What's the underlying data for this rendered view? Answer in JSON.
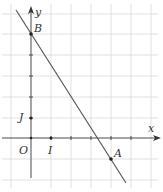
{
  "diagram": {
    "type": "coordinate-plane-line",
    "axes": {
      "x_label": "x",
      "y_label": "y",
      "origin_label": "O",
      "unit_x_label": "I",
      "unit_y_label": "J"
    },
    "points": [
      {
        "name": "B",
        "x": 0,
        "y": 5
      },
      {
        "name": "A",
        "x": 4,
        "y": -1
      },
      {
        "name": "I",
        "x": 1,
        "y": 0
      },
      {
        "name": "J",
        "x": 0,
        "y": 1
      },
      {
        "name": "O",
        "x": 0,
        "y": 0
      }
    ],
    "line": {
      "through": [
        "B",
        "A"
      ]
    },
    "grid": {
      "x_range": [
        -1,
        6
      ],
      "y_range": [
        -2,
        6
      ],
      "step": 1
    },
    "colors": {
      "grid": "#d9d9d9",
      "axis": "#4a4a4a",
      "line": "#5a5a5a",
      "point": "#222222"
    }
  }
}
